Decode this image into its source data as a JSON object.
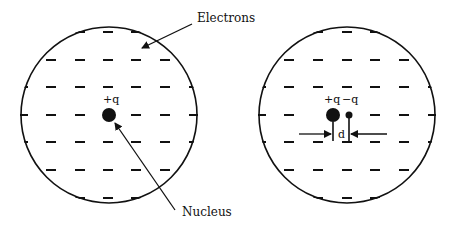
{
  "diagram": {
    "left": {
      "nucleus_label": "+q",
      "electrons_label": "Electrons",
      "nucleus_caption": "Nucleus"
    },
    "right": {
      "positive_label": "+q",
      "negative_label": "−q",
      "separation_label": "d"
    },
    "colors": {
      "stroke": "#111111",
      "background": "#ffffff"
    }
  }
}
